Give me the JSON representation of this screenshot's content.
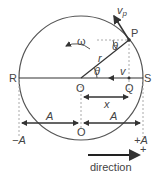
{
  "diagram": {
    "points": {
      "P": "P",
      "Q": "Q",
      "R": "R",
      "S": "S",
      "O": "O",
      "O_axis": "O"
    },
    "symbols": {
      "omega": "ω",
      "theta_top": "θ",
      "theta_center": "θ",
      "r": "r",
      "v": "v",
      "vp": "v",
      "vp_sub": "p",
      "x": "x"
    },
    "amplitude": {
      "left": "A",
      "right": "A",
      "neg": "−A",
      "pos": "+A"
    },
    "direction": {
      "label": "direction",
      "sign": "+"
    },
    "colors": {
      "line": "#333333",
      "dashed": "#aaaaaa",
      "text": "#444444"
    }
  }
}
